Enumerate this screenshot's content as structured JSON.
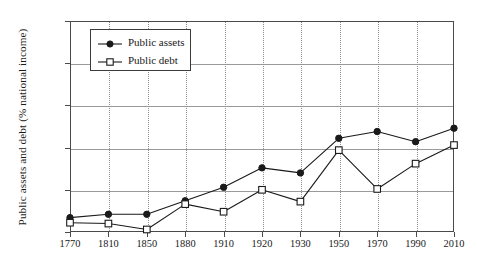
{
  "chart_data": {
    "type": "line",
    "title": "",
    "xlabel": "",
    "ylabel": "Public assets and debt (% national income)",
    "categories": [
      "1770",
      "1810",
      "1850",
      "1880",
      "1910",
      "1920",
      "1930",
      "1950",
      "1970",
      "1990",
      "2010"
    ],
    "series": [
      {
        "name": "Public assets",
        "marker": "filled-circle",
        "values": [
          17,
          21,
          21,
          37,
          53,
          76,
          70,
          111,
          119,
          107,
          123
        ]
      },
      {
        "name": "Public debt",
        "marker": "open-square",
        "values": [
          11,
          10,
          3,
          33,
          24,
          50,
          36,
          97,
          51,
          81,
          103
        ]
      }
    ],
    "ylim": [
      0,
      250
    ],
    "yticks": [
      0,
      50,
      100,
      150,
      200,
      250
    ],
    "ytick_labels": [
      "0%",
      "50%",
      "100%",
      "150%",
      "200%",
      "250%"
    ],
    "grid": {
      "horizontal": true,
      "vertical": true,
      "vertical_style": "dotted"
    },
    "legend": {
      "position": "top-left",
      "entries": [
        "Public assets",
        "Public debt"
      ]
    },
    "colors": {
      "line": "#1a1a1a",
      "grid_horizontal": "#9a9a9a",
      "grid_vertical": "#8e8e8e",
      "frame": "#4a4a4a",
      "background": "#ffffff"
    }
  }
}
